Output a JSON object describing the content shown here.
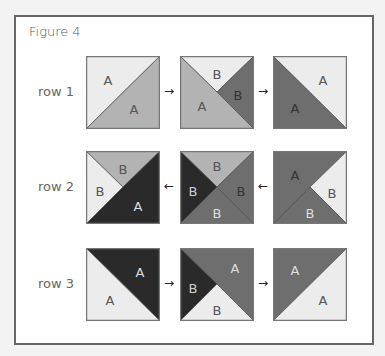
{
  "figure": {
    "title": "Figure 4",
    "colors": {
      "light": "#ececec",
      "medium": "#b3b3b3",
      "darkgray": "#6e6e6e",
      "black": "#2a2a2a",
      "edge": "#777777"
    },
    "rows": [
      {
        "label": "row 1",
        "arrow": "→",
        "arrow_direction": "right",
        "squares": [
          {
            "pieces": [
              {
                "pts": "0,0 74,0 0,73",
                "fill": "#ececec",
                "label": "A",
                "lx": 22,
                "ly": 24,
                "lc": "#555"
              },
              {
                "pts": "74,0 74,73 0,73",
                "fill": "#b3b3b3",
                "label": "A",
                "lx": 48,
                "ly": 53,
                "lc": "#555"
              }
            ]
          },
          {
            "pieces": [
              {
                "pts": "0,0 74,0 37,36",
                "fill": "#ececec",
                "label": "B",
                "lx": 37,
                "ly": 18,
                "lc": "#555"
              },
              {
                "pts": "74,0 74,73 37,36",
                "fill": "#6e6e6e",
                "label": "B",
                "lx": 58,
                "ly": 39,
                "lc": "#333"
              },
              {
                "pts": "0,0 37,36 74,73 0,73",
                "fill": "#b3b3b3",
                "label": "A",
                "lx": 22,
                "ly": 50,
                "lc": "#555"
              }
            ]
          },
          {
            "pieces": [
              {
                "pts": "0,0 74,0 74,73",
                "fill": "#ececec",
                "label": "A",
                "lx": 50,
                "ly": 24,
                "lc": "#555"
              },
              {
                "pts": "0,0 74,73 0,73",
                "fill": "#6e6e6e",
                "label": "A",
                "lx": 22,
                "ly": 52,
                "lc": "#333"
              }
            ]
          }
        ]
      },
      {
        "label": "row 2",
        "arrow": "←",
        "arrow_direction": "left",
        "squares": [
          {
            "pieces": [
              {
                "pts": "0,0 74,0 37,36",
                "fill": "#b3b3b3",
                "label": "B",
                "lx": 37,
                "ly": 18,
                "lc": "#555"
              },
              {
                "pts": "0,0 37,36 0,73",
                "fill": "#ececec",
                "label": "B",
                "lx": 14,
                "ly": 40,
                "lc": "#555"
              },
              {
                "pts": "74,0 74,73 0,73 37,36",
                "fill": "#2a2a2a",
                "label": "A",
                "lx": 52,
                "ly": 55,
                "lc": "#ddd"
              }
            ]
          },
          {
            "pieces": [
              {
                "pts": "0,0 74,0 37,36",
                "fill": "#b3b3b3",
                "label": "B",
                "lx": 37,
                "ly": 15,
                "lc": "#555"
              },
              {
                "pts": "0,0 37,36 0,73",
                "fill": "#2a2a2a",
                "label": "B",
                "lx": 13,
                "ly": 40,
                "lc": "#ccc"
              },
              {
                "pts": "74,0 74,73 37,36",
                "fill": "#6e6e6e",
                "label": "B",
                "lx": 61,
                "ly": 40,
                "lc": "#333"
              },
              {
                "pts": "0,73 37,36 74,73",
                "fill": "#6e6e6e",
                "label": "B",
                "lx": 37,
                "ly": 62,
                "lc": "#ddd"
              }
            ]
          },
          {
            "pieces": [
              {
                "pts": "0,0 74,0 37,36 0,73",
                "fill": "#6e6e6e",
                "label": "A",
                "lx": 22,
                "ly": 24,
                "lc": "#333"
              },
              {
                "pts": "74,0 74,73 37,36",
                "fill": "#ececec",
                "label": "B",
                "lx": 59,
                "ly": 42,
                "lc": "#555"
              },
              {
                "pts": "0,73 37,36 74,73",
                "fill": "#6e6e6e",
                "label": "B",
                "lx": 37,
                "ly": 62,
                "lc": "#ddd"
              }
            ]
          }
        ]
      },
      {
        "label": "row 3",
        "arrow": "→",
        "arrow_direction": "right",
        "squares": [
          {
            "pieces": [
              {
                "pts": "0,0 74,0 74,73",
                "fill": "#2a2a2a",
                "label": "A",
                "lx": 54,
                "ly": 24,
                "lc": "#ddd"
              },
              {
                "pts": "0,0 74,73 0,73",
                "fill": "#ececec",
                "label": "A",
                "lx": 24,
                "ly": 52,
                "lc": "#555"
              }
            ]
          },
          {
            "pieces": [
              {
                "pts": "0,0 74,0 74,73 37,36",
                "fill": "#6e6e6e",
                "label": "A",
                "lx": 55,
                "ly": 20,
                "lc": "#ddd"
              },
              {
                "pts": "0,0 37,36 0,73",
                "fill": "#2a2a2a",
                "label": "B",
                "lx": 13,
                "ly": 40,
                "lc": "#ccc"
              },
              {
                "pts": "0,73 37,36 74,73",
                "fill": "#ececec",
                "label": "B",
                "lx": 37,
                "ly": 62,
                "lc": "#555"
              }
            ]
          },
          {
            "pieces": [
              {
                "pts": "0,0 74,0 0,73",
                "fill": "#6e6e6e",
                "label": "A",
                "lx": 22,
                "ly": 22,
                "lc": "#ddd"
              },
              {
                "pts": "74,0 74,73 0,73",
                "fill": "#ececec",
                "label": "A",
                "lx": 50,
                "ly": 52,
                "lc": "#555"
              }
            ]
          }
        ]
      }
    ]
  }
}
